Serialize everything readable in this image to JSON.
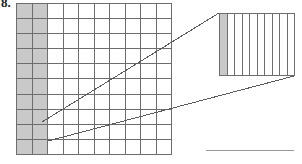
{
  "figure": {
    "problem_number": "8.",
    "caption": "",
    "type": "grid-magnification-diagram"
  },
  "main_grid": {
    "name": "hundredths-grid",
    "columns": 10,
    "rows": 10,
    "total_cells": 100,
    "shaded_columns": 2,
    "shaded_cells": 20,
    "shaded_fraction": "20/100",
    "column_states": [
      "shaded",
      "shaded",
      "empty",
      "empty",
      "empty",
      "empty",
      "empty",
      "empty",
      "empty",
      "empty"
    ],
    "row_labels": [
      "",
      "",
      "",
      "",
      "",
      "",
      "",
      "",
      "",
      ""
    ],
    "column_labels": [
      "",
      "",
      "",
      "",
      "",
      "",
      "",
      "",
      "",
      ""
    ],
    "grid_line_color": "#6d6d6d",
    "shade_color": "#c9c9c9",
    "background_color": "#ffffff"
  },
  "callout_panel": {
    "name": "magnified-strip-view",
    "strips": 10,
    "shaded_strips": 1,
    "shaded_fraction": "1/10",
    "strip_states": [
      "shaded",
      "empty",
      "empty",
      "empty",
      "empty",
      "empty",
      "empty",
      "empty",
      "empty",
      "empty"
    ],
    "orientation": "vertical",
    "border_color": "#6d6d6d",
    "shade_color": "#c9c9c9",
    "background_color": "#ffffff"
  },
  "leader_lines": {
    "name": "magnification-connector",
    "color": "#5a5a5a",
    "count": 2,
    "upper": {
      "x1": 42,
      "y1": 122,
      "x2": 219,
      "y2": 13
    },
    "lower": {
      "x1": 48,
      "y1": 141,
      "x2": 294,
      "y2": 76
    }
  },
  "bottom_rule": {
    "name": "answer-rule",
    "color": "#9a9a9a",
    "x": 206,
    "y": 150,
    "width": 88
  },
  "colors": {
    "ink": "#1d1d1d",
    "line": "#6d6d6d",
    "shade": "#c9c9c9",
    "rule": "#9a9a9a",
    "page": "#ffffff"
  }
}
